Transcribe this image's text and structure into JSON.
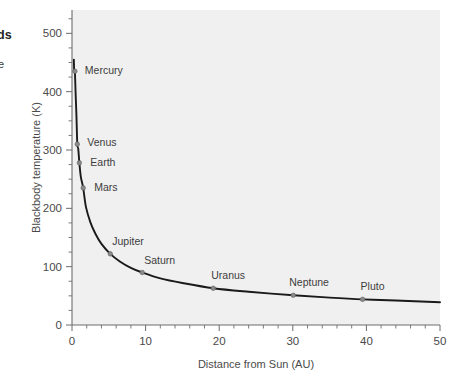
{
  "margin_notes": {
    "bold_fragment": "ds",
    "light_fragment": "e"
  },
  "chart_data": {
    "type": "line",
    "title": "",
    "xlabel": "Distance from Sun (AU)",
    "ylabel": "Blackbody temperature (K)",
    "xlim": [
      0,
      50
    ],
    "ylim": [
      0,
      540
    ],
    "grid": false,
    "legend": "none",
    "x_ticks": [
      0,
      10,
      20,
      30,
      40,
      50
    ],
    "x_tick_labels": [
      "0",
      "10",
      "20",
      "30",
      "40",
      "50"
    ],
    "x_minor_step": 2,
    "y_ticks": [
      0,
      100,
      200,
      300,
      400,
      500
    ],
    "y_tick_labels": [
      "0",
      "100",
      "200",
      "300",
      "400",
      "500"
    ],
    "y_minor_step": 25,
    "curve_relation": "T = 278.6 / sqrt(d)",
    "curve": {
      "x": [
        0.25,
        0.3,
        0.39,
        0.5,
        0.6,
        0.72,
        0.85,
        1.0,
        1.2,
        1.52,
        1.9,
        2.5,
        3.2,
        4.0,
        5.2,
        6.5,
        8.0,
        9.54,
        12.0,
        15.0,
        19.19,
        24.0,
        30.06,
        35.0,
        39.48,
        44.0,
        50.0
      ],
      "y": [
        455,
        436,
        435,
        394,
        360,
        310,
        302,
        278,
        254,
        235,
        202,
        176,
        156,
        139,
        122,
        109,
        98,
        90,
        80,
        72,
        63,
        57,
        51,
        47,
        44,
        42,
        39
      ]
    },
    "points": [
      {
        "label": "Mercury",
        "x": 0.39,
        "y": 435,
        "label_dx": 10,
        "label_dy": 3
      },
      {
        "label": "Venus",
        "x": 0.72,
        "y": 310,
        "label_dx": 10,
        "label_dy": 2
      },
      {
        "label": "Earth",
        "x": 1.0,
        "y": 278,
        "label_dx": 11,
        "label_dy": 3
      },
      {
        "label": "Mars",
        "x": 1.52,
        "y": 235,
        "label_dx": 11,
        "label_dy": 3
      },
      {
        "label": "Jupiter",
        "x": 5.2,
        "y": 122,
        "label_dx": 2,
        "label_dy": -9
      },
      {
        "label": "Saturn",
        "x": 9.54,
        "y": 90,
        "label_dx": 2,
        "label_dy": -9
      },
      {
        "label": "Uranus",
        "x": 19.19,
        "y": 63,
        "label_dx": -2,
        "label_dy": -9
      },
      {
        "label": "Neptune",
        "x": 30.06,
        "y": 51,
        "label_dx": -4,
        "label_dy": -9
      },
      {
        "label": "Pluto",
        "x": 39.48,
        "y": 44,
        "label_dx": -2,
        "label_dy": -9
      }
    ]
  },
  "colors": {
    "panel_background": "#f0f0f0",
    "page_background": "#ffffff",
    "curve": "#1a1a1a",
    "axis": "#6d6d6d",
    "marker": "#8a8a8a",
    "label_text": "#3d3d3d"
  }
}
